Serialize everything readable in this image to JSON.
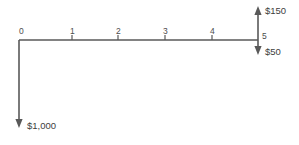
{
  "diagram": {
    "type": "cash-flow-timeline",
    "title": "",
    "background_color": "#ffffff",
    "line_color": "#595959",
    "text_color": "#3d3d3d",
    "axis": {
      "start_period": 0,
      "end_period": 5,
      "tick_labels": [
        "0",
        "1",
        "2",
        "3",
        "4",
        "5"
      ]
    },
    "periods": [
      {
        "label": "0",
        "x": 19
      },
      {
        "label": "1",
        "x": 72
      },
      {
        "label": "2",
        "x": 118
      },
      {
        "label": "3",
        "x": 165
      },
      {
        "label": "4",
        "x": 212
      },
      {
        "label": "5",
        "x": 258
      }
    ],
    "cash_flows": [
      {
        "period": "0",
        "amount_label": "$1,000",
        "direction": "down",
        "sign": "outflow"
      },
      {
        "period": "5",
        "amount_label": "$150",
        "direction": "up",
        "sign": "inflow"
      },
      {
        "period": "5",
        "amount_label": "$50",
        "direction": "down",
        "sign": "outflow"
      }
    ]
  }
}
